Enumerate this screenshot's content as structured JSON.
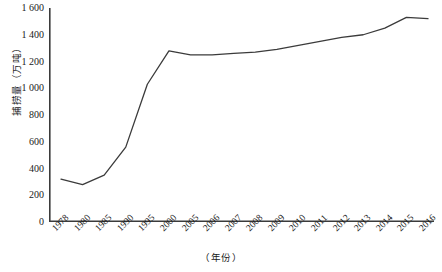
{
  "chart_data": {
    "type": "line",
    "title": "",
    "xlabel": "（年份）",
    "ylabel": "捕捞量（万吨）",
    "categories": [
      "1978",
      "1980",
      "1985",
      "1990",
      "1995",
      "2000",
      "2005",
      "2006",
      "2007",
      "2008",
      "2009",
      "2010",
      "2011",
      "2012",
      "2013",
      "2014",
      "2015",
      "2016"
    ],
    "values": [
      320,
      280,
      350,
      560,
      1030,
      1280,
      1250,
      1250,
      1260,
      1270,
      1290,
      1320,
      1350,
      1380,
      1400,
      1450,
      1530,
      1520
    ],
    "ylim": [
      0,
      1600
    ],
    "yticks": [
      0,
      200,
      400,
      600,
      800,
      1000,
      1200,
      1400,
      1600
    ],
    "ytick_labels": [
      "0",
      "200",
      "400",
      "600",
      "800",
      "1 000",
      "1 200",
      "1 400",
      "1 600"
    ],
    "grid": false,
    "legend": "none",
    "series_color": "#3b3b3b",
    "axis_color": "#3b3b3b"
  }
}
